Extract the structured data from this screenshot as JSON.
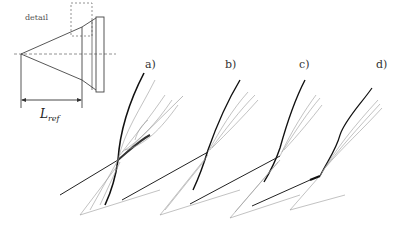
{
  "schematic": {
    "detail_label": "detail",
    "length_label": "L",
    "length_subscript": "ref"
  },
  "panels": [
    {
      "label": "a)"
    },
    {
      "label": "b)"
    },
    {
      "label": "c)"
    },
    {
      "label": "d)"
    }
  ],
  "colors": {
    "shock": "#111111",
    "contour": "#999999",
    "schematic": "#444444"
  }
}
